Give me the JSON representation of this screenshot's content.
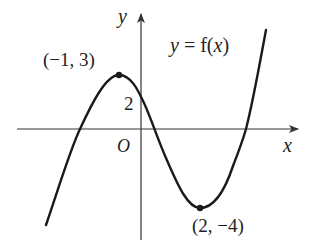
{
  "figure": {
    "function_label": "y = f(x)",
    "function_label_parts": {
      "y": "y",
      "eq": " = f(",
      "x": "x",
      "close": ")"
    },
    "axes": {
      "x_label": "x",
      "y_label": "y",
      "origin_label": "O"
    },
    "points": [
      {
        "name": "local-maximum",
        "label": "(−1, 3)",
        "x": -1,
        "y": 3
      },
      {
        "name": "local-minimum",
        "label": "(2, −4)",
        "x": 2,
        "y": -4
      }
    ],
    "y_intercept": {
      "label": "2",
      "value": 2
    },
    "colors": {
      "curve": "#1a1a1a",
      "axes": "#333333",
      "text": "#222222",
      "background": "#ffffff"
    }
  }
}
